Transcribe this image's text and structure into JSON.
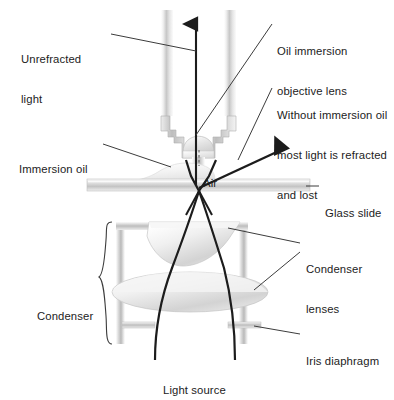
{
  "figure": {
    "background_color": "#ffffff",
    "ink_color": "#1c1c1c",
    "line_color": "#4a4a4a"
  },
  "labels": {
    "unrefracted_light": "Unrefracted\nlight",
    "unrefracted_light_line1": "Unrefracted",
    "unrefracted_light_line2": "light",
    "immersion_oil": "Immersion oil",
    "oil_immersion_objective_lens_line1": "Oil immersion",
    "oil_immersion_objective_lens_line2": "objective lens",
    "without_oil_line1": "Without immersion oil",
    "without_oil_line2": "most light is refracted",
    "without_oil_line3": "and lost",
    "air": "Air",
    "glass_slide": "Glass slide",
    "condenser_lenses_line1": "Condenser",
    "condenser_lenses_line2": "lenses",
    "condenser": "Condenser",
    "iris_diaphragm": "Iris diaphragm",
    "light_source": "Light source"
  },
  "icons": {
    "unrefracted_ray_arrow": "up-arrow-icon",
    "refracted_ray_arrow": "up-right-arrow-icon",
    "condenser_brace": "curly-brace-icon",
    "air_gap_marker": "dashed-line-icon"
  },
  "colors": {
    "glass_light": "#f2f2f2",
    "glass_mid": "#d2d2d2",
    "glass_dark": "#a8a8a8",
    "metal_light": "#fbfbfb",
    "metal_mid": "#c9c9c9",
    "metal_dark": "#9a9a9a",
    "oil": "#ededed",
    "ray": "#1c1c1c",
    "leader": "#3c3c3c"
  },
  "parts": [
    {
      "name": "objective-barrel-left",
      "kind": "metal-column"
    },
    {
      "name": "objective-barrel-right",
      "kind": "metal-column"
    },
    {
      "name": "objective-stepped-nose",
      "kind": "stepped-metal"
    },
    {
      "name": "front-lens-element",
      "kind": "glass-dome"
    },
    {
      "name": "immersion-oil-drop",
      "kind": "oil-blob"
    },
    {
      "name": "glass-slide",
      "kind": "glass-bar"
    },
    {
      "name": "condenser-top-lens",
      "kind": "glass-lens"
    },
    {
      "name": "condenser-bottom-lens",
      "kind": "glass-lens"
    },
    {
      "name": "condenser-housing",
      "kind": "metal-frame"
    },
    {
      "name": "iris-diaphragm-left-blade",
      "kind": "metal-blade"
    },
    {
      "name": "iris-diaphragm-right-blade",
      "kind": "metal-blade"
    }
  ],
  "rays": [
    {
      "name": "unrefracted-ray",
      "description": "vertical ray with up arrowhead through objective"
    },
    {
      "name": "refracted-ray",
      "description": "ray bent up-right out of the objective, lost"
    },
    {
      "name": "left-condenser-ray",
      "description": "ray from light source through condenser to slide"
    },
    {
      "name": "right-condenser-ray",
      "description": "ray from light source through condenser to slide"
    }
  ]
}
